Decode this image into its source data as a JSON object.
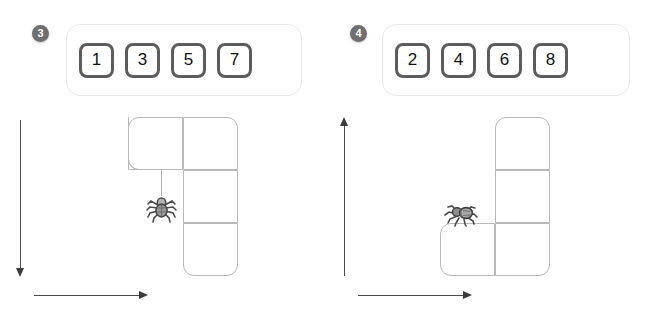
{
  "page": {
    "background_color": "#ffffff",
    "badge_color": "#6f6f6f",
    "tile_border_color": "#5c5c5c",
    "grid_line_color": "#b9b9b9",
    "axis_color": "#3b3b3b"
  },
  "panels": [
    {
      "badge": "3",
      "tiles": [
        "1",
        "3",
        "5",
        "7"
      ],
      "figure": {
        "shape_name": "j-tetromino-top-row",
        "cells": [
          {
            "col": 0,
            "row": 0
          },
          {
            "col": 1,
            "row": 0
          },
          {
            "col": 1,
            "row": 1
          },
          {
            "col": 1,
            "row": 2
          }
        ],
        "vertical_axis_direction": "down",
        "horizontal_axis_direction": "right",
        "spider": {
          "pose": "hanging",
          "icon": "spider-icon",
          "attached_to": "thread"
        }
      }
    },
    {
      "badge": "4",
      "tiles": [
        "2",
        "4",
        "6",
        "8"
      ],
      "figure": {
        "shape_name": "j-tetromino-bottom-row",
        "cells": [
          {
            "col": 1,
            "row": 0
          },
          {
            "col": 1,
            "row": 1
          },
          {
            "col": 0,
            "row": 2
          },
          {
            "col": 1,
            "row": 2
          }
        ],
        "vertical_axis_direction": "up",
        "horizontal_axis_direction": "right",
        "spider": {
          "pose": "crawling",
          "icon": "spider-icon",
          "attached_to": "cell-edge"
        }
      }
    }
  ]
}
